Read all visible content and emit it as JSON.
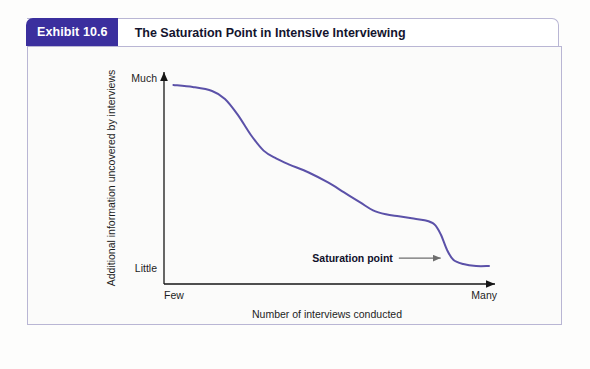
{
  "exhibit": {
    "badge_label": "Exhibit 10.6",
    "title": "The Saturation Point in Intensive Interviewing",
    "badge_color": "#3b2f9e",
    "frame_border_color": "#b9b6d4",
    "panel_background": "#fbfbfa"
  },
  "chart_data": {
    "type": "line",
    "title": "The Saturation Point in Intensive Interviewing",
    "xlabel": "Number of interviews conducted",
    "ylabel": "Additional information uncovered by interviews",
    "x_tick_labels": [
      "Few",
      "Many"
    ],
    "y_tick_labels": [
      "Little",
      "Much"
    ],
    "xlim": [
      0,
      100
    ],
    "ylim": [
      0,
      100
    ],
    "grid": false,
    "legend": "none",
    "line_color": "#5b51a8",
    "line_width": 2,
    "series": [
      {
        "name": "Additional information uncovered",
        "x": [
          2,
          8,
          14,
          18,
          22,
          26,
          30,
          34,
          38,
          44,
          50,
          55,
          60,
          64,
          68,
          72,
          76,
          80,
          83,
          85,
          87,
          89,
          92,
          96,
          100
        ],
        "y": [
          97,
          96,
          94,
          90,
          82,
          72,
          64,
          60,
          57,
          53,
          48,
          43,
          38,
          34,
          32,
          31,
          30,
          29,
          27,
          22,
          14,
          9,
          7,
          6,
          6
        ]
      }
    ],
    "annotations": [
      {
        "label": "Saturation point",
        "text_x": 63,
        "text_y": 10,
        "arrow_from_x": 72,
        "arrow_to_x": 85,
        "arrow_y": 10,
        "arrow_color": "#6e6e6e",
        "description": "Arrow pointing right to the steep drop in the curve"
      }
    ]
  }
}
